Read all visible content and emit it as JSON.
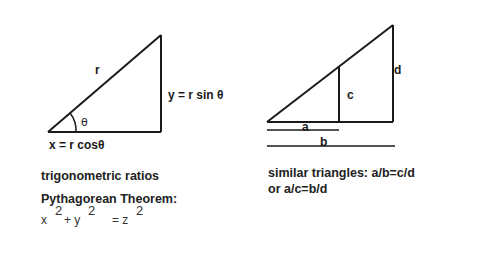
{
  "left_panel": {
    "hypotenuse_label": "r",
    "angle_label": "θ",
    "opposite_label": "y = r sin θ",
    "adjacent_label": "x = r cosθ",
    "caption": "trigonometric ratios",
    "theorem_title": "Pythagorean Theorem:",
    "equation": {
      "x": "x",
      "x_exp": "2",
      "plus_y": "+ y",
      "y_exp": "2",
      "equals_z": "= z",
      "z_exp": "2"
    }
  },
  "right_panel": {
    "label_a": "a",
    "label_b": "b",
    "label_c": "c",
    "label_d": "d",
    "caption_line1": "similar triangles: a/b=c/d",
    "caption_line2": "or a/c=b/d"
  },
  "colors": {
    "stroke": "#1a1a1a",
    "border": "#555555",
    "background": "#ffffff"
  }
}
